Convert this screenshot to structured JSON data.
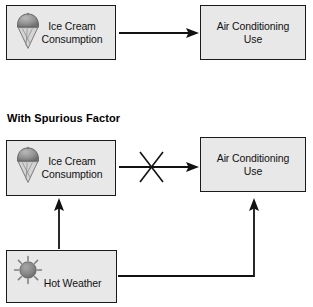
{
  "diagram": {
    "title_visible": false,
    "section_heading": "With Spurious Factor",
    "colors": {
      "box_fill": "#e8e8e8",
      "box_border": "#1a1a1a",
      "arrow": "#121212",
      "icon_gray": "#8a8a8a",
      "text": "#111111",
      "background": "#ffffff"
    },
    "nodes": {
      "cause_top": {
        "label": "Ice Cream\nConsumption",
        "icon": "ice-cream-cone-icon"
      },
      "effect_top": {
        "label": "Air Conditioning\nUse",
        "icon": null
      },
      "cause_mid": {
        "label": "Ice Cream\nConsumption",
        "icon": "ice-cream-cone-icon"
      },
      "effect_mid": {
        "label": "Air Conditioning\nUse",
        "icon": null
      },
      "confounder": {
        "label": "Hot Weather",
        "icon": "sun-icon"
      }
    },
    "edges": [
      {
        "name": "edge-cause-to-effect-top",
        "from": "cause_top",
        "to": "effect_top",
        "style": "solid-arrow",
        "struck_out": false
      },
      {
        "name": "edge-cause-to-effect-mid",
        "from": "cause_mid",
        "to": "effect_mid",
        "style": "solid-arrow",
        "struck_out": true,
        "strike_marker": "x-cross-icon"
      },
      {
        "name": "edge-confounder-to-cause",
        "from": "confounder",
        "to": "cause_mid",
        "style": "solid-arrow",
        "struck_out": false
      },
      {
        "name": "edge-confounder-to-effect",
        "from": "confounder",
        "to": "effect_mid",
        "style": "elbow-arrow",
        "struck_out": false
      }
    ]
  }
}
